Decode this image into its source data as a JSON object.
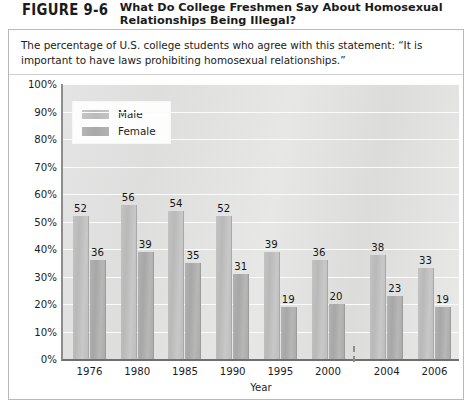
{
  "figure": {
    "number": "FIGURE 9-6",
    "title": "What Do College Freshmen Say About Homosexual Relationships Being Illegal?",
    "subtitle": "The percentage of U.S. college students who agree with this statement: “It is important to have laws prohibiting homosexual relationships.”"
  },
  "chart_data": {
    "type": "bar",
    "title": "What Do College Freshmen Say About Homosexual Relationships Being Illegal?",
    "xlabel": "Year",
    "ylabel": "",
    "categories": [
      "1976",
      "1980",
      "1985",
      "1990",
      "1995",
      "2000",
      "2004",
      "2006"
    ],
    "series": [
      {
        "name": "Male",
        "color": "#bfbfbf",
        "values": [
          52,
          56,
          54,
          52,
          39,
          36,
          38,
          33
        ]
      },
      {
        "name": "Female",
        "color": "#ababab",
        "values": [
          36,
          39,
          35,
          31,
          19,
          20,
          23,
          19
        ]
      }
    ],
    "ylim": [
      0,
      100
    ],
    "y_ticks": [
      "0%",
      "10%",
      "20%",
      "30%",
      "40%",
      "50%",
      "60%",
      "70%",
      "80%",
      "90%",
      "100%"
    ],
    "grid": true,
    "legend_position": "top-left",
    "value_labels": true,
    "axis_break_after_category": "2000",
    "note": "Dashed vertical break on the x-axis between the 2000 and 2004 groups indicates a change in survey interval."
  }
}
